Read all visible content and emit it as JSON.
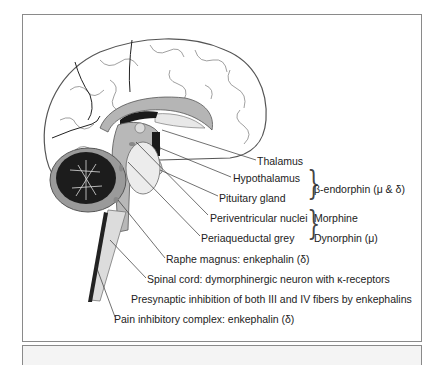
{
  "figure": {
    "type": "anatomical-diagram",
    "labels": {
      "thalamus": "Thalamus",
      "hypothalamus": "Hypothalamus",
      "pituitary": "Pituitary gland",
      "periventricular": "Periventricular nuclei",
      "periaqueductal": "Periaqueductal grey",
      "raphe": "Raphe magnus: enkephalin (δ)",
      "spinal_cord": "Spinal cord: dymorphinergic neuron with κ-receptors",
      "presynaptic": "Presynaptic inhibition of both III and IV fibers by enkephalins",
      "pain_complex": "Pain inhibitory complex: enkephalin (δ)"
    },
    "group_labels": {
      "beta_endorphin": "β-endorphin (μ & δ)",
      "morphine": "Morphine",
      "dynorphin": "Dynorphin (μ)"
    },
    "colors": {
      "frame": "#8a8a8a",
      "brain_fill": "#ffffff",
      "brain_outline": "#555555",
      "grey_matter": "#b5b5b5",
      "dark": "#1a1a1a",
      "stem": "#dcdcdc"
    }
  }
}
